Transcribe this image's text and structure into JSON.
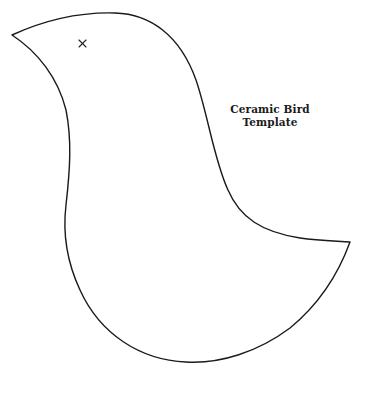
{
  "template": {
    "title_line1": "Ceramic Bird",
    "title_line2": "Template"
  },
  "shape": {
    "type": "bird-outline",
    "stroke_color": "#1a1a1a",
    "background_color": "#ffffff"
  },
  "eye_marker": {
    "glyph": "×"
  }
}
